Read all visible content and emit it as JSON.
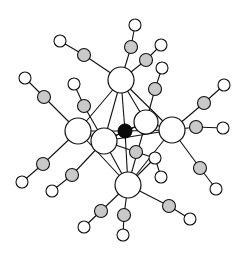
{
  "figure": {
    "title": "",
    "colors": {
      "background": "#ffffff",
      "bond": "#111111",
      "metal_fill": "#ffffff",
      "carbon_fill": "#c9c9c9",
      "oxygen_fill": "#ffffff",
      "interstitial_fill": "#0a0a0a"
    },
    "legend": []
  },
  "atoms": {
    "interstitial": {
      "id": "X",
      "x": 125,
      "y": 131,
      "r": 7
    },
    "metals": [
      {
        "id": "M1",
        "x": 121,
        "y": 80,
        "r": 13
      },
      {
        "id": "M2",
        "x": 78,
        "y": 131,
        "r": 13
      },
      {
        "id": "M3",
        "x": 104,
        "y": 141,
        "r": 13
      },
      {
        "id": "M4",
        "x": 146,
        "y": 122,
        "r": 12
      },
      {
        "id": "M5",
        "x": 172,
        "y": 130,
        "r": 13
      },
      {
        "id": "M6",
        "x": 128,
        "y": 185,
        "r": 13
      }
    ],
    "ligands": [
      {
        "metal": "M1",
        "c": [
          131,
          47
        ],
        "o": [
          135,
          25
        ]
      },
      {
        "metal": "M1",
        "c": [
          146,
          60
        ],
        "o": [
          161,
          45
        ]
      },
      {
        "metal": "M1",
        "c": [
          84,
          55
        ],
        "o": [
          60,
          41
        ]
      },
      {
        "metal": "M2",
        "c": [
          44,
          97
        ],
        "o": [
          25,
          78
        ]
      },
      {
        "metal": "M2",
        "c": [
          43,
          164
        ],
        "o": [
          22,
          182
        ]
      },
      {
        "metal": "M3",
        "c": [
          84,
          106
        ],
        "o": [
          74,
          84
        ]
      },
      {
        "metal": "M3",
        "c": [
          72,
          175
        ],
        "o": [
          52,
          191
        ]
      },
      {
        "metal": "M4",
        "c": [
          155,
          89
        ],
        "o": [
          162,
          68
        ]
      },
      {
        "metal": "M5",
        "c": [
          204,
          103
        ],
        "o": [
          224,
          85
        ]
      },
      {
        "metal": "M5",
        "c": [
          196,
          127
        ],
        "o": [
          223,
          128
        ]
      },
      {
        "metal": "M5",
        "c": [
          200,
          168
        ],
        "o": [
          216,
          189
        ]
      },
      {
        "metal": "M6",
        "c": [
          101,
          211
        ],
        "o": [
          84,
          227
        ]
      },
      {
        "metal": "M6",
        "c": [
          124,
          215
        ],
        "o": [
          123,
          235
        ]
      },
      {
        "metal": "M6",
        "c": [
          169,
          206
        ],
        "o": [
          190,
          219
        ]
      },
      {
        "metal": "M3",
        "c": [
          136,
          152
        ],
        "o": [
          155,
          158
        ]
      }
    ],
    "extra_oxygens": [
      {
        "x": 161,
        "y": 177,
        "r": 7,
        "bonded_to": [
          155,
          158
        ]
      }
    ]
  }
}
